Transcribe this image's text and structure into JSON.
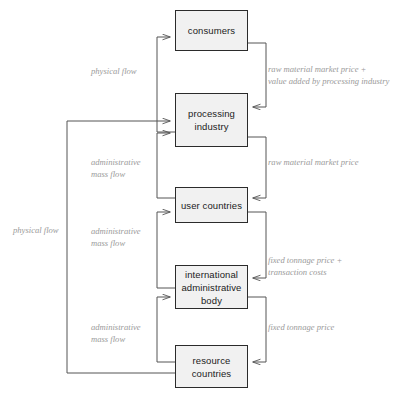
{
  "diagram": {
    "colors": {
      "box_fill": "#f1f1f1",
      "box_border": "#2b2b2b",
      "box_text": "#1b1b1b",
      "edge_line": "#555555",
      "edge_label_text": "#9a9a9a",
      "background": "#ffffff"
    },
    "nodes": [
      {
        "id": "consumers",
        "label": "consumers"
      },
      {
        "id": "processing-industry",
        "label": "processing\nindustry"
      },
      {
        "id": "user-countries",
        "label": "user countries"
      },
      {
        "id": "international-administrative-body",
        "label": "international\nadministrative\nbody"
      },
      {
        "id": "resource-countries",
        "label": "resource\ncountries"
      }
    ],
    "edge_labels": [
      {
        "id": "physical-flow-top",
        "text": "physical flow"
      },
      {
        "id": "raw-material-market-price-plus-value-added",
        "text": "raw material market price +\nvalue added by processing industry"
      },
      {
        "id": "administrative-mass-flow-1",
        "text": "administrative\nmass flow"
      },
      {
        "id": "raw-material-market-price",
        "text": "raw material market price"
      },
      {
        "id": "physical-flow-left",
        "text": "physical flow"
      },
      {
        "id": "administrative-mass-flow-2",
        "text": "administrative\nmass flow"
      },
      {
        "id": "fixed-tonnage-price-plus-transaction-costs",
        "text": "fixed tonnage price +\ntransaction costs"
      },
      {
        "id": "administrative-mass-flow-3",
        "text": "administrative\nmass flow"
      },
      {
        "id": "fixed-tonnage-price",
        "text": "fixed tonnage price"
      }
    ]
  }
}
